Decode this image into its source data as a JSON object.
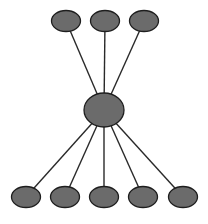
{
  "diagram": {
    "type": "hub-and-spoke tree",
    "colors": {
      "node_fill": "#6b6b6b",
      "node_stroke": "#1e1e1e",
      "edge": "#2a2a2a",
      "background": "#ffffff"
    },
    "hub": {
      "id": "hub",
      "cx": 104,
      "cy": 110,
      "rx": 20,
      "ry": 17
    },
    "top_nodes": [
      {
        "id": "top-1",
        "cx": 66,
        "cy": 21,
        "rx": 14.5,
        "ry": 10.5
      },
      {
        "id": "top-2",
        "cx": 105,
        "cy": 21,
        "rx": 14.5,
        "ry": 10.5
      },
      {
        "id": "top-3",
        "cx": 144,
        "cy": 21,
        "rx": 14.5,
        "ry": 10.5
      }
    ],
    "bottom_nodes": [
      {
        "id": "bottom-1",
        "cx": 26,
        "cy": 197,
        "rx": 14.5,
        "ry": 10.5
      },
      {
        "id": "bottom-2",
        "cx": 65,
        "cy": 197,
        "rx": 14.5,
        "ry": 10.5
      },
      {
        "id": "bottom-3",
        "cx": 104,
        "cy": 197,
        "rx": 14.5,
        "ry": 10.5
      },
      {
        "id": "bottom-4",
        "cx": 143,
        "cy": 197,
        "rx": 14.5,
        "ry": 10.5
      },
      {
        "id": "bottom-5",
        "cx": 183,
        "cy": 197,
        "rx": 14.5,
        "ry": 10.5
      }
    ],
    "edges": [
      {
        "from": "hub",
        "to": "top-1"
      },
      {
        "from": "hub",
        "to": "top-2"
      },
      {
        "from": "hub",
        "to": "top-3"
      },
      {
        "from": "hub",
        "to": "bottom-1"
      },
      {
        "from": "hub",
        "to": "bottom-2"
      },
      {
        "from": "hub",
        "to": "bottom-3"
      },
      {
        "from": "hub",
        "to": "bottom-4"
      },
      {
        "from": "hub",
        "to": "bottom-5"
      }
    ]
  }
}
